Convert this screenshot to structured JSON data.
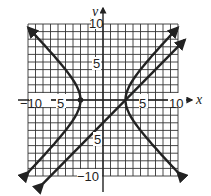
{
  "chart_data": {
    "type": "line",
    "title": "",
    "xlabel": "x",
    "ylabel": "y",
    "xlim": [
      -10,
      10
    ],
    "ylim": [
      -10,
      10
    ],
    "grid": true,
    "grid_step": 1,
    "x_tick_labels": [
      "-10",
      "-5",
      "5",
      "10"
    ],
    "y_tick_labels": [
      "10",
      "5",
      "-5",
      "-10"
    ],
    "series": [
      {
        "name": "hyperbola",
        "equation": "x^2/9 - y^2/9 = 1",
        "vertices": [
          [
            -3,
            0
          ],
          [
            3,
            0
          ]
        ],
        "marked_points": [
          [
            -3,
            0
          ]
        ]
      },
      {
        "name": "line",
        "equation": "y = x - 3",
        "points": [
          [
            -7,
            -10
          ],
          [
            10,
            7
          ]
        ]
      }
    ]
  },
  "labels": {
    "x_axis": "x",
    "y_axis": "y",
    "x_neg10": "−10",
    "x_neg5": "−5",
    "x_pos5": "5",
    "x_pos10": "10",
    "y_pos10": "10",
    "y_pos5": "5",
    "y_neg5": "−5",
    "y_neg10": "−10"
  },
  "colors": {
    "ink": "#222222",
    "grid": "#333333",
    "background": "#ffffff"
  }
}
